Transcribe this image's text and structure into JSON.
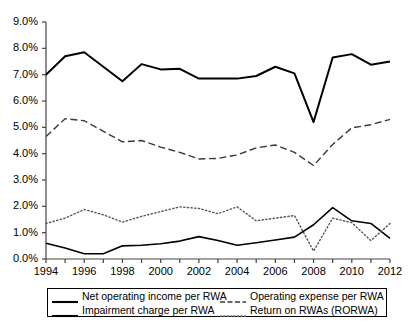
{
  "chart_data": {
    "type": "line",
    "title": "",
    "subtitle": "",
    "xlabel": "",
    "ylabel": "",
    "grid": false,
    "legend_position": "bottom",
    "xlim": [
      1994,
      2012
    ],
    "ylim": [
      0.0,
      9.0
    ],
    "yticks": [
      "0.0%",
      "1.0%",
      "2.0%",
      "3.0%",
      "4.0%",
      "5.0%",
      "6.0%",
      "7.0%",
      "8.0%",
      "9.0%"
    ],
    "ytick_values": [
      0.0,
      1.0,
      2.0,
      3.0,
      4.0,
      5.0,
      6.0,
      7.0,
      8.0,
      9.0
    ],
    "xticks": [
      "1994",
      "1996",
      "1998",
      "2000",
      "2002",
      "2004",
      "2006",
      "2008",
      "2010",
      "2012"
    ],
    "xtick_values": [
      1994,
      1996,
      1998,
      2000,
      2002,
      2004,
      2006,
      2008,
      2010,
      2012
    ],
    "x": [
      1994,
      1995,
      1996,
      1997,
      1998,
      1999,
      2000,
      2001,
      2002,
      2003,
      2004,
      2005,
      2006,
      2007,
      2008,
      2009,
      2010,
      2011,
      2012
    ],
    "series": [
      {
        "name": "Net operating income per RWA",
        "style": "solid",
        "width": 2.0,
        "color": "#000000",
        "values": [
          7.0,
          7.7,
          7.85,
          7.3,
          6.75,
          7.4,
          7.2,
          7.22,
          6.85,
          6.85,
          6.85,
          6.95,
          7.3,
          7.05,
          5.2,
          7.65,
          7.78,
          7.38,
          7.5
        ]
      },
      {
        "name": "Operating expense per RWA",
        "style": "dashed",
        "width": 1.4,
        "color": "#3a3a3a",
        "values": [
          4.65,
          5.33,
          5.25,
          4.85,
          4.45,
          4.5,
          4.25,
          4.05,
          3.8,
          3.82,
          3.95,
          4.22,
          4.33,
          4.05,
          3.55,
          4.35,
          4.98,
          5.1,
          5.3
        ]
      },
      {
        "name": "Impairment charge per RWA",
        "style": "solid",
        "width": 1.6,
        "color": "#000000",
        "values": [
          0.6,
          0.42,
          0.2,
          0.2,
          0.5,
          0.52,
          0.58,
          0.68,
          0.85,
          0.7,
          0.52,
          0.62,
          0.72,
          0.83,
          1.3,
          1.95,
          1.45,
          1.35,
          0.78
        ]
      },
      {
        "name": "Return on RWAs (RORWA)",
        "style": "dotted",
        "width": 1.4,
        "color": "#555555",
        "values": [
          1.35,
          1.55,
          1.88,
          1.68,
          1.4,
          1.62,
          1.8,
          1.98,
          1.92,
          1.72,
          1.98,
          1.45,
          1.55,
          1.65,
          0.3,
          1.55,
          1.38,
          0.7,
          1.35
        ]
      }
    ]
  },
  "legend": {
    "entries": [
      {
        "label": "Net operating income per RWA",
        "style": "solid"
      },
      {
        "label": "Operating expense per RWA",
        "style": "dashed"
      },
      {
        "label": "Impairment charge per RWA",
        "style": "solid"
      },
      {
        "label": "Return on RWAs (RORWA)",
        "style": "dotted"
      }
    ]
  }
}
